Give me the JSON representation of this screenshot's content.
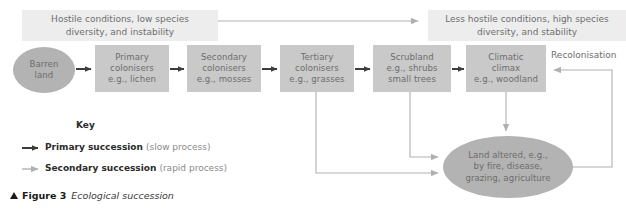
{
  "figure": {
    "marker": "triangle-up-icon",
    "number": "Figure 3",
    "title": "Ecological succession"
  },
  "banners": {
    "left": "Hostile conditions, low species\ndiversity, and instability",
    "right": "Less hostile conditions, high species\ndiversity, and stability"
  },
  "gradient_arrow": {
    "name": "conditions-gradient-arrow"
  },
  "stages": [
    {
      "id": "barren-land",
      "shape": "ellipse",
      "label": "Barren\nland"
    },
    {
      "id": "primary-colonisers",
      "shape": "box",
      "label": "Primary\ncolonisers\ne.g., lichen"
    },
    {
      "id": "secondary-colonisers",
      "shape": "box",
      "label": "Secondary\ncolonisers\ne.g., mosses"
    },
    {
      "id": "tertiary-colonisers",
      "shape": "box",
      "label": "Tertiary\ncolonisers\ne.g., grasses"
    },
    {
      "id": "scrubland",
      "shape": "box",
      "label": "Scrubland\ne.g., shrubs\nsmall trees"
    },
    {
      "id": "climatic-climax",
      "shape": "box",
      "label": "Climatic\nclimax\ne.g., woodland"
    }
  ],
  "disturbance": {
    "id": "land-altered",
    "shape": "ellipse",
    "label": "Land altered, e.g.,\nby fire, disease,\ngrazing, agriculture"
  },
  "recolonisation": {
    "label": "Recolonisation"
  },
  "key": {
    "title": "Key",
    "items": [
      {
        "arrow": "primary-arrow-dark",
        "strong": "Primary succession",
        "weak": "(slow process)"
      },
      {
        "arrow": "secondary-arrow-light",
        "strong": "Secondary succession",
        "weak": "(rapid process)"
      }
    ]
  },
  "colors": {
    "box_fill": "#c9c9c9",
    "ellipse_fill": "#b3b3b3",
    "banner_fill": "#ededed",
    "primary_arrow": "#3d3d3d",
    "secondary_arrow": "#b0b0b0",
    "text": "#6d6d6d"
  }
}
